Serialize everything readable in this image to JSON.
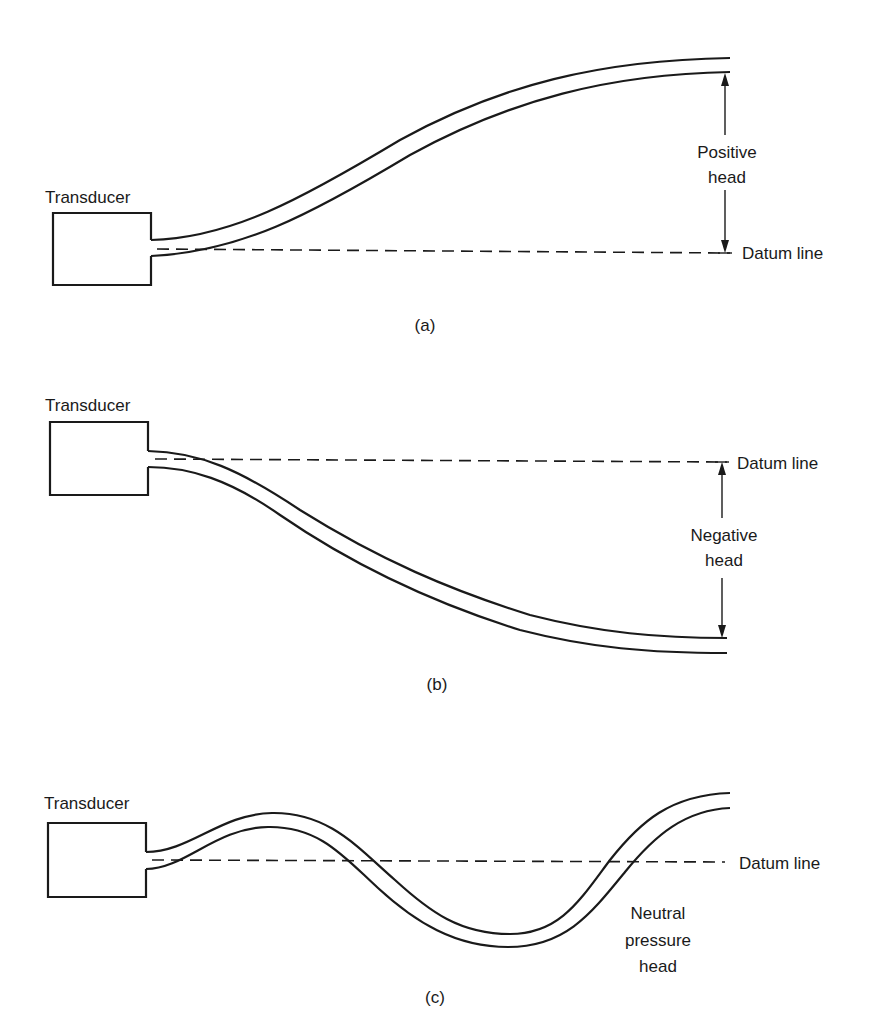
{
  "panels": [
    {
      "id": "a",
      "caption": "(a)",
      "transducer_label": "Transducer",
      "datum_label": "Datum line",
      "head_label_line1": "Positive",
      "head_label_line2": "head"
    },
    {
      "id": "b",
      "caption": "(b)",
      "transducer_label": "Transducer",
      "datum_label": "Datum line",
      "head_label_line1": "Negative",
      "head_label_line2": "head"
    },
    {
      "id": "c",
      "caption": "(c)",
      "transducer_label": "Transducer",
      "datum_label": "Datum line",
      "head_label_line1": "Neutral",
      "head_label_line2": "pressure",
      "head_label_line3": "head"
    }
  ],
  "colors": {
    "ink": "#1a1a1a",
    "background": "#ffffff"
  }
}
